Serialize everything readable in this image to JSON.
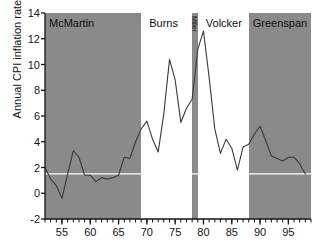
{
  "chart_data": {
    "type": "line",
    "title": "",
    "xlabel": "",
    "ylabel": "Annual CPI inflation rate (%)",
    "xlim": [
      1952,
      1999
    ],
    "ylim": [
      -2,
      14
    ],
    "yticks": [
      -2,
      0,
      2,
      4,
      6,
      8,
      10,
      12,
      14
    ],
    "xticks": [
      55,
      60,
      65,
      70,
      75,
      80,
      85,
      90,
      95
    ],
    "xtick_labels": [
      "55",
      "60",
      "65",
      "70",
      "75",
      "80",
      "85",
      "90",
      "95"
    ],
    "ytick_labels": [
      "-2",
      "0",
      "2",
      "4",
      "6",
      "8",
      "10",
      "12",
      "14"
    ],
    "grid": false,
    "legend": "none",
    "minor_xticks_every": 1,
    "reference_line_y": 1.5,
    "reference_line_color": "#ffffff",
    "line_color": "#3a3a3a",
    "band_color": "#8a8a8a",
    "background_color": "#ffffff",
    "x": [
      1952,
      1953,
      1954,
      1955,
      1956,
      1957,
      1958,
      1959,
      1960,
      1961,
      1962,
      1963,
      1964,
      1965,
      1966,
      1967,
      1968,
      1969,
      1970,
      1971,
      1972,
      1973,
      1974,
      1975,
      1976,
      1977,
      1978,
      1979,
      1980,
      1981,
      1982,
      1983,
      1984,
      1985,
      1986,
      1987,
      1988,
      1989,
      1990,
      1991,
      1992,
      1993,
      1994,
      1995,
      1996,
      1997,
      1998
    ],
    "values": [
      2.0,
      1.1,
      0.6,
      -0.4,
      1.5,
      3.3,
      2.8,
      1.4,
      1.4,
      0.9,
      1.2,
      1.1,
      1.2,
      1.4,
      2.8,
      2.7,
      4.0,
      5.0,
      5.6,
      4.2,
      3.2,
      6.2,
      10.4,
      8.8,
      5.5,
      6.6,
      7.3,
      11.2,
      12.6,
      9.0,
      5.0,
      3.1,
      4.2,
      3.5,
      1.8,
      3.6,
      3.8,
      4.6,
      5.2,
      4.1,
      2.9,
      2.7,
      2.5,
      2.8,
      2.8,
      2.3,
      1.5
    ]
  },
  "bands": [
    {
      "name": "McMartin",
      "label": "McMartin",
      "start": 1952,
      "end": 1969,
      "orientation": "horizontal"
    },
    {
      "name": "Miller",
      "label": "Miller",
      "start": 1978,
      "end": 1979,
      "orientation": "vertical"
    },
    {
      "name": "Greenspan",
      "label": "Greenspan",
      "start": 1988,
      "end": 1999,
      "orientation": "horizontal"
    }
  ],
  "unshaded_labels": [
    {
      "name": "Burns",
      "label": "Burns",
      "start": 1969,
      "end": 1978
    },
    {
      "name": "Volcker",
      "label": "Volcker",
      "start": 1979,
      "end": 1988
    }
  ]
}
